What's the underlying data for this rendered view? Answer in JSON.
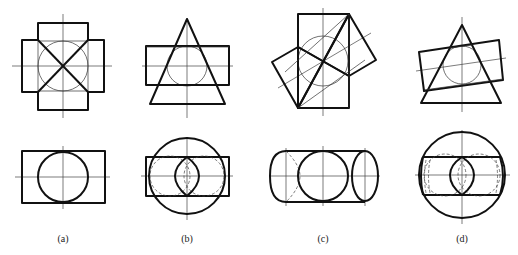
{
  "figure": {
    "panels": [
      {
        "id": "a",
        "label": "(a)",
        "top_view": "cross-shaped prisms with inscribed circle and diagonals",
        "bottom_view": "rectangle with inscribed circle"
      },
      {
        "id": "b",
        "label": "(b)",
        "top_view": "triangle over rectangle with inscribed circle",
        "bottom_view": "large circle, rectangle, two dashed circles, lens-shaped intersection"
      },
      {
        "id": "c",
        "label": "(c)",
        "top_view": "rotated square over rectangle with circle and inclined center lines",
        "bottom_view": "cylinder with circle and elliptical ends"
      },
      {
        "id": "d",
        "label": "(d)",
        "top_view": "tilted rectangle over triangle with circle",
        "bottom_view": "large circle, cylinder with dashed circles and lens intersection"
      }
    ]
  }
}
